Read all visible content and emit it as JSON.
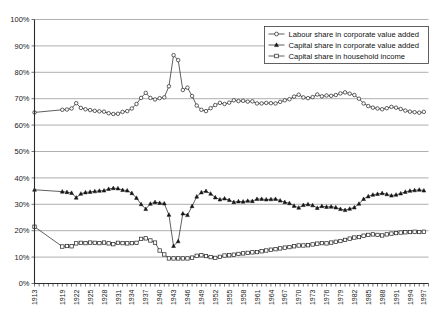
{
  "chart_data": {
    "type": "line",
    "title": "",
    "xlabel": "",
    "ylabel": "",
    "ylim": [
      0,
      100
    ],
    "xlim": [
      1913,
      1998
    ],
    "grid": true,
    "legend_position": "top-right",
    "y_ticks": [
      "0%",
      "10%",
      "20%",
      "30%",
      "40%",
      "50%",
      "60%",
      "70%",
      "80%",
      "90%",
      "100%"
    ],
    "y_tick_values": [
      0,
      10,
      20,
      30,
      40,
      50,
      60,
      70,
      80,
      90,
      100
    ],
    "x_tick_labels": [
      "1913",
      "1919",
      "1922",
      "1925",
      "1928",
      "1931",
      "1934",
      "1937",
      "1940",
      "1943",
      "1946",
      "1949",
      "1952",
      "1955",
      "1958",
      "1961",
      "1964",
      "1967",
      "1970",
      "1973",
      "1976",
      "1979",
      "1982",
      "1985",
      "1988",
      "1991",
      "1994",
      "1997"
    ],
    "x_tick_values": [
      1913,
      1919,
      1922,
      1925,
      1928,
      1931,
      1934,
      1937,
      1940,
      1943,
      1946,
      1949,
      1952,
      1955,
      1958,
      1961,
      1964,
      1967,
      1970,
      1973,
      1976,
      1979,
      1982,
      1985,
      1988,
      1991,
      1994,
      1997
    ],
    "series": [
      {
        "name": "Labour share in corporate value added",
        "marker": "open-circle",
        "x": [
          1913,
          1919,
          1920,
          1921,
          1922,
          1923,
          1924,
          1925,
          1926,
          1927,
          1928,
          1929,
          1930,
          1931,
          1932,
          1933,
          1934,
          1935,
          1936,
          1937,
          1938,
          1939,
          1940,
          1941,
          1942,
          1943,
          1944,
          1945,
          1946,
          1947,
          1948,
          1949,
          1950,
          1951,
          1952,
          1953,
          1954,
          1955,
          1956,
          1957,
          1958,
          1959,
          1960,
          1961,
          1962,
          1963,
          1964,
          1965,
          1966,
          1967,
          1968,
          1969,
          1970,
          1971,
          1972,
          1973,
          1974,
          1975,
          1976,
          1977,
          1978,
          1979,
          1980,
          1981,
          1982,
          1983,
          1984,
          1985,
          1986,
          1987,
          1988,
          1989,
          1990,
          1991,
          1992,
          1993,
          1994,
          1995,
          1996,
          1997
        ],
        "y": [
          64.8,
          65.8,
          65.9,
          66.3,
          68.3,
          66.5,
          66.0,
          65.7,
          65.4,
          65.2,
          65.1,
          64.5,
          64.2,
          64.3,
          65.0,
          65.3,
          66.3,
          68.0,
          70.3,
          72.2,
          70.3,
          69.7,
          70.2,
          70.5,
          74.7,
          86.5,
          84.6,
          73.3,
          74.2,
          71.0,
          67.4,
          65.8,
          65.3,
          66.4,
          67.6,
          68.4,
          68.0,
          68.5,
          69.4,
          69.1,
          69.2,
          68.9,
          69.0,
          68.2,
          68.2,
          68.4,
          68.3,
          68.2,
          68.8,
          69.4,
          69.8,
          70.8,
          71.5,
          70.5,
          70.2,
          70.6,
          71.6,
          70.9,
          71.2,
          71.1,
          71.4,
          72.0,
          72.4,
          71.9,
          71.4,
          70.0,
          68.2,
          67.2,
          66.6,
          66.3,
          66.0,
          66.4,
          66.9,
          66.6,
          66.1,
          65.5,
          65.1,
          64.9,
          64.7,
          65.0
        ]
      },
      {
        "name": "Capital share in corporate value added",
        "marker": "filled-triangle",
        "x": [
          1913,
          1919,
          1920,
          1921,
          1922,
          1923,
          1924,
          1925,
          1926,
          1927,
          1928,
          1929,
          1930,
          1931,
          1932,
          1933,
          1934,
          1935,
          1936,
          1937,
          1938,
          1939,
          1940,
          1941,
          1942,
          1943,
          1944,
          1945,
          1946,
          1947,
          1948,
          1949,
          1950,
          1951,
          1952,
          1953,
          1954,
          1955,
          1956,
          1957,
          1958,
          1959,
          1960,
          1961,
          1962,
          1963,
          1964,
          1965,
          1966,
          1967,
          1968,
          1969,
          1970,
          1971,
          1972,
          1973,
          1974,
          1975,
          1976,
          1977,
          1978,
          1979,
          1980,
          1981,
          1982,
          1983,
          1984,
          1985,
          1986,
          1987,
          1988,
          1989,
          1990,
          1991,
          1992,
          1993,
          1994,
          1995,
          1996,
          1997
        ],
        "y": [
          35.5,
          34.8,
          34.6,
          34.3,
          32.5,
          34.0,
          34.5,
          34.7,
          34.9,
          35.1,
          35.2,
          35.8,
          36.1,
          36.0,
          35.4,
          35.2,
          34.2,
          32.4,
          30.0,
          28.2,
          30.2,
          30.8,
          30.5,
          30.3,
          26.0,
          14.2,
          16.0,
          26.5,
          25.9,
          29.3,
          32.9,
          34.5,
          35.0,
          34.0,
          32.6,
          31.8,
          32.2,
          31.6,
          30.8,
          31.1,
          31.0,
          31.3,
          31.2,
          32.0,
          32.0,
          31.8,
          31.9,
          32.0,
          31.4,
          30.8,
          30.4,
          29.4,
          28.7,
          29.7,
          30.0,
          29.6,
          28.6,
          29.3,
          29.0,
          29.1,
          28.8,
          28.2,
          27.8,
          28.3,
          28.8,
          30.2,
          32.0,
          33.0,
          33.6,
          33.9,
          34.2,
          33.8,
          33.3,
          33.6,
          34.1,
          34.7,
          35.1,
          35.3,
          35.5,
          35.2
        ]
      },
      {
        "name": "Capital share in household income",
        "marker": "open-square",
        "x": [
          1913,
          1919,
          1920,
          1921,
          1922,
          1923,
          1924,
          1925,
          1926,
          1927,
          1928,
          1929,
          1930,
          1931,
          1932,
          1933,
          1934,
          1935,
          1936,
          1937,
          1938,
          1939,
          1940,
          1941,
          1942,
          1943,
          1944,
          1945,
          1946,
          1947,
          1948,
          1949,
          1950,
          1951,
          1952,
          1953,
          1954,
          1955,
          1956,
          1957,
          1958,
          1959,
          1960,
          1961,
          1962,
          1963,
          1964,
          1965,
          1966,
          1967,
          1968,
          1969,
          1970,
          1971,
          1972,
          1973,
          1974,
          1975,
          1976,
          1977,
          1978,
          1979,
          1980,
          1981,
          1982,
          1983,
          1984,
          1985,
          1986,
          1987,
          1988,
          1989,
          1990,
          1991,
          1992,
          1993,
          1994,
          1995,
          1996,
          1997
        ],
        "y": [
          21.5,
          14.0,
          14.2,
          14.1,
          15.2,
          15.4,
          15.3,
          15.5,
          15.4,
          15.3,
          15.5,
          15.2,
          14.9,
          15.4,
          15.3,
          15.2,
          15.3,
          15.4,
          16.9,
          17.1,
          16.3,
          15.5,
          12.5,
          11.0,
          9.5,
          9.5,
          9.5,
          9.5,
          9.5,
          9.8,
          10.5,
          10.7,
          10.4,
          10.0,
          9.7,
          10.1,
          10.6,
          10.7,
          10.9,
          11.2,
          11.4,
          11.6,
          11.8,
          11.9,
          12.2,
          12.5,
          12.8,
          13.0,
          13.3,
          13.6,
          13.8,
          14.1,
          14.4,
          14.4,
          14.5,
          14.8,
          15.1,
          15.3,
          15.2,
          15.5,
          15.8,
          16.1,
          16.5,
          17.0,
          17.4,
          17.6,
          18.1,
          18.4,
          18.6,
          18.4,
          18.2,
          18.6,
          18.9,
          19.1,
          19.3,
          19.4,
          19.5,
          19.6,
          19.5,
          19.6
        ]
      }
    ]
  },
  "legend": {
    "items": [
      {
        "label": "Labour share in corporate value added",
        "marker": "open-circle"
      },
      {
        "label": "Capital share in corporate value added",
        "marker": "filled-triangle"
      },
      {
        "label": "Capital share in household income",
        "marker": "open-square"
      }
    ]
  },
  "colors": {
    "line": "#2a2a2a",
    "grid": "#9a9a9a",
    "axis": "#2b2b2b",
    "text": "#1a1a1a",
    "background": "#ffffff"
  }
}
